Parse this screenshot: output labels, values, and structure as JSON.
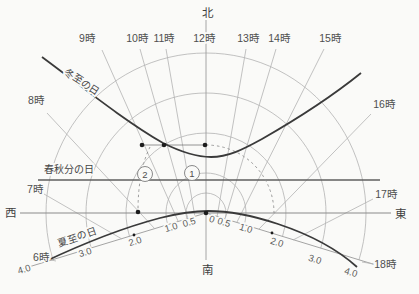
{
  "diagram": {
    "canvas": {
      "width": 419,
      "height": 294
    },
    "colors": {
      "bg": "#fafaf8",
      "curve": "#3a3a3a",
      "mid": "#6e6e6e",
      "light": "#b3b3b3",
      "ruler": "#9a9a9a",
      "text": "#4a4a4a",
      "dot": "#1c1c1c"
    },
    "origin": {
      "x": 206,
      "y": 213
    },
    "convergence": {
      "x": 206,
      "y": 283
    },
    "cardinals": [
      {
        "id": "north",
        "label": "北",
        "x": 207,
        "y": 13
      },
      {
        "id": "south",
        "label": "南",
        "x": 207,
        "y": 270
      },
      {
        "id": "west",
        "label": "西",
        "x": 10,
        "y": 213
      },
      {
        "id": "east",
        "label": "東",
        "x": 400,
        "y": 214
      }
    ],
    "axes": {
      "vertical": {
        "x1": 206,
        "y1": 20,
        "x2": 206,
        "y2": 260
      },
      "horizontal": {
        "x1": 20,
        "y1": 213,
        "x2": 391,
        "y2": 213
      }
    },
    "hour_lines": [
      {
        "label": "6時",
        "lx": 41,
        "ly": 257,
        "x1": 56,
        "y1": 261,
        "x2": 46,
        "y2": 259
      },
      {
        "label": "7時",
        "lx": 35,
        "ly": 189,
        "x1": 122,
        "y1": 239,
        "x2": 44,
        "y2": 194
      },
      {
        "label": "8時",
        "lx": 36,
        "ly": 100,
        "x1": 155,
        "y1": 229,
        "x2": 47,
        "y2": 113
      },
      {
        "label": "9時",
        "lx": 87,
        "ly": 38,
        "x1": 178,
        "y1": 221,
        "x2": 102,
        "y2": 50
      },
      {
        "label": "10時",
        "lx": 137,
        "ly": 38,
        "x1": 188,
        "y1": 219,
        "x2": 140,
        "y2": 49
      },
      {
        "label": "11時",
        "lx": 164,
        "ly": 38,
        "x1": 195,
        "y1": 217,
        "x2": 166,
        "y2": 49
      },
      {
        "label": "12時",
        "lx": 204,
        "ly": 38,
        "x1": 206,
        "y1": 213,
        "x2": 206,
        "y2": 213
      },
      {
        "label": "13時",
        "lx": 248,
        "ly": 38,
        "x1": 217,
        "y1": 217,
        "x2": 246,
        "y2": 49
      },
      {
        "label": "14時",
        "lx": 279,
        "ly": 38,
        "x1": 225,
        "y1": 219,
        "x2": 276,
        "y2": 49
      },
      {
        "label": "15時",
        "lx": 330,
        "ly": 38,
        "x1": 237,
        "y1": 222,
        "x2": 324,
        "y2": 49
      },
      {
        "label": "16時",
        "lx": 384,
        "ly": 104,
        "x1": 259,
        "y1": 229,
        "x2": 371,
        "y2": 114
      },
      {
        "label": "17時",
        "lx": 386,
        "ly": 194,
        "x1": 293,
        "y1": 240,
        "x2": 373,
        "y2": 199
      },
      {
        "label": "18時",
        "lx": 385,
        "ly": 264,
        "x1": 374,
        "y1": 264,
        "x2": 362,
        "y2": 262
      }
    ],
    "curves": {
      "winter": {
        "label": "冬至の日",
        "label_x": 82,
        "label_y": 82,
        "label_rotation": 33,
        "path": "M42,57 C85,89 125,121 163,143 C185,154 198,157 211,157 C228,157 242,150 262,139 C290,123 330,98 361,73"
      },
      "equinox": {
        "label": "春秋分の日",
        "label_x": 69,
        "label_y": 169,
        "x1": 38,
        "y1": 180,
        "x2": 380,
        "y2": 180
      },
      "summer": {
        "label": "夏至の日",
        "label_x": 77,
        "label_y": 237,
        "label_rotation": -19,
        "path": "M44,262 C80,245 122,228 160,218 C180,213 195,211 208,211 C230,211 254,216 278,224 C305,233 336,248 357,267"
      }
    },
    "shadow_scale": {
      "unit_px": 40,
      "clip_deg": 17,
      "circles": [
        {
          "value": "0.5",
          "r": 20
        },
        {
          "value": "1.0",
          "r": 40
        },
        {
          "value": "2.0",
          "r": 80
        },
        {
          "value": "3.0",
          "r": 120
        },
        {
          "value": "4.0",
          "r": 160
        }
      ],
      "rulers": {
        "left": {
          "x1": 206,
          "y1": 213,
          "x2": 22,
          "y2": 269
        },
        "right": {
          "x1": 206,
          "y1": 213,
          "x2": 376,
          "y2": 265
        }
      },
      "labels_left": [
        {
          "text": "0.5",
          "x": 189,
          "y": 222
        },
        {
          "text": "1.0",
          "x": 171,
          "y": 227
        },
        {
          "text": "2.0",
          "x": 135,
          "y": 241
        },
        {
          "text": "3.0",
          "x": 85,
          "y": 252
        },
        {
          "text": "4.0",
          "x": 24,
          "y": 269
        }
      ],
      "labels_right": [
        {
          "text": "0",
          "x": 212,
          "y": 219
        },
        {
          "text": "0.5",
          "x": 224,
          "y": 222
        },
        {
          "text": "1.0",
          "x": 246,
          "y": 228
        },
        {
          "text": "2.0",
          "x": 277,
          "y": 242
        },
        {
          "text": "3.0",
          "x": 315,
          "y": 259
        },
        {
          "text": "4.0",
          "x": 351,
          "y": 272
        }
      ],
      "rotation_left": -17,
      "rotation_right": 17
    },
    "construction": {
      "segment": {
        "x1": 142,
        "y1": 145,
        "x2": 205,
        "y2": 145
      },
      "dashed_arc_east": "M206,145 A68,68 0 0 1 274,213",
      "dashed_curve_west": "M150,147 Q138,171 138,211",
      "dots": [
        {
          "x": 142,
          "y": 145
        },
        {
          "x": 164,
          "y": 145
        },
        {
          "x": 205,
          "y": 145
        },
        {
          "x": 138,
          "y": 212
        },
        {
          "x": 206,
          "y": 213
        }
      ],
      "small_dots": [
        {
          "x": 134,
          "y": 235
        },
        {
          "x": 272,
          "y": 233
        }
      ],
      "markers": [
        {
          "number": "1",
          "x": 192,
          "y": 173
        },
        {
          "number": "2",
          "x": 145,
          "y": 174
        }
      ]
    }
  }
}
